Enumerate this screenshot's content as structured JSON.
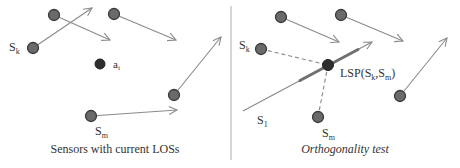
{
  "colors": {
    "sensor_fill": "#6a6a6a",
    "sensor_stroke": "#3a3a3a",
    "target_fill": "#2e2e2e",
    "arrow": "#8a8a8a",
    "dashed": "#888888",
    "thick_segment": "#707070",
    "divider": "#bbbbbb",
    "text": "#333333"
  },
  "left_panel": {
    "caption": "Sensors with current LOSs",
    "labels": {
      "sk": "S",
      "sk_sub": "k",
      "sm": "S",
      "sm_sub": "m",
      "ai": "a",
      "ai_sub": "i"
    },
    "sensors": [
      {
        "id": "s-top-left",
        "x": 54,
        "y": 15,
        "to": [
          110,
          40
        ]
      },
      {
        "id": "s-k",
        "x": 33,
        "y": 48,
        "to": [
          92,
          8
        ]
      },
      {
        "id": "s-top-mid",
        "x": 114,
        "y": 14,
        "to": [
          176,
          40
        ]
      },
      {
        "id": "s-right",
        "x": 174,
        "y": 95,
        "to": [
          221,
          37
        ]
      },
      {
        "id": "s-m",
        "x": 91,
        "y": 116,
        "to": [
          177,
          110
        ]
      }
    ],
    "target": {
      "id": "a-i",
      "x": 100,
      "y": 64
    }
  },
  "right_panel": {
    "caption": "Orthogonality test",
    "labels": {
      "sk": "S",
      "sk_sub": "k",
      "sm": "S",
      "sm_sub": "m",
      "s1": "S",
      "s1_sub": "1",
      "lsp_prefix": "LSP(S",
      "lsp_sub1": "k",
      "lsp_mid": ",S",
      "lsp_sub2": "m",
      "lsp_suffix": ")"
    },
    "sensors": [
      {
        "id": "s-top-left",
        "x": 281,
        "y": 17,
        "to": [
          339,
          42
        ]
      },
      {
        "id": "s-top-mid",
        "x": 341,
        "y": 15,
        "to": [
          403,
          41
        ]
      },
      {
        "id": "s-right",
        "x": 400,
        "y": 96,
        "to": [
          447,
          38
        ]
      },
      {
        "id": "s-k",
        "x": 261,
        "y": 49
      },
      {
        "id": "s-m",
        "x": 318,
        "y": 117
      }
    ],
    "s1_line": {
      "from": [
        243,
        111
      ],
      "to": [
        372,
        42
      ]
    },
    "lsp_point": {
      "x": 328,
      "y": 65
    }
  }
}
